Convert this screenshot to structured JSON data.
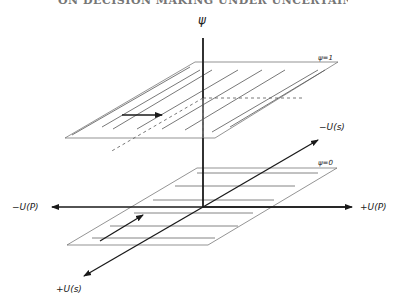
{
  "header": {
    "partial_title": "ON DECISION MAKING UNDER UNCERTAINTY"
  },
  "diagram": {
    "vertical_axis_label": "ψ",
    "upper_plane_label": "ψ=1",
    "lower_plane_label": "ψ=0",
    "depth_axis_negative_label": "−U(s)",
    "depth_axis_positive_label": "+U(s)",
    "horizontal_axis_negative_label": "−U(P)",
    "horizontal_axis_positive_label": "+U(P)",
    "colors": {
      "ink": "#1a1a1a",
      "thin_line": "#555555",
      "background": "#ffffff"
    }
  }
}
